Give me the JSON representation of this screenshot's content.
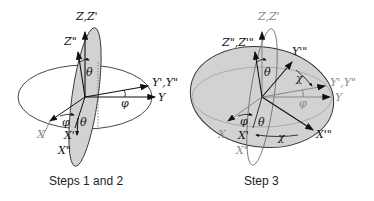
{
  "panels": [
    {
      "caption": "Steps 1 and 2",
      "labels": {
        "z_zp": "Z,Z'",
        "zpp": "Z\"",
        "theta_top": "θ",
        "ypyp": "Y',Y\"",
        "y": "Y",
        "phi_right": "φ",
        "phi_left": "φ",
        "theta_bottom": "θ",
        "x": "X",
        "xp": "X'",
        "xpp": "X\""
      }
    },
    {
      "caption": "Step 3",
      "labels": {
        "z_zp": "Z,Z'",
        "zpp_zppp": "Z\",Z'\"",
        "theta_top": "θ",
        "yppp": "Y'\"",
        "chi_top": "χ",
        "ypyp": "Y',Y\"",
        "y": "Y",
        "phi_right": "φ",
        "phi_left": "φ",
        "theta_bottom": "θ",
        "x": "X",
        "xp": "X'",
        "chi_bottom": "χ",
        "xppp": "X'\"",
        "xpp": "X\""
      }
    }
  ],
  "colors": {
    "fill": "#d2d2d2",
    "line": "#222222",
    "faint": "#9a9a9a"
  }
}
